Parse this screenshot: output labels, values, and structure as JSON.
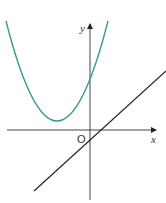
{
  "diagram": {
    "axes": {
      "x_label": "x",
      "y_label": "y",
      "origin_label": "O",
      "color": "#222222"
    },
    "curves": [
      {
        "name": "parabola",
        "type": "quadratic",
        "color": "#3a9a86",
        "vertex_px": [
          57,
          121
        ]
      },
      {
        "name": "line",
        "type": "linear",
        "color": "#222222",
        "slope": "positive"
      }
    ]
  }
}
